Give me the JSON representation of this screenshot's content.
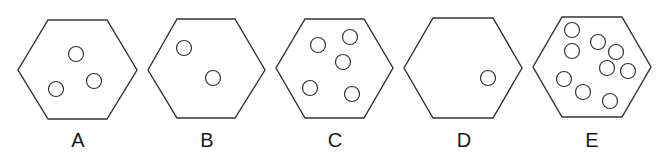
{
  "figure": {
    "stroke_color": "#333333",
    "panels": [
      {
        "label": "A",
        "circle_count": 3,
        "hexagon": [
          [
            48,
            20
          ],
          [
            107,
            20
          ],
          [
            137,
            70
          ],
          [
            107,
            119
          ],
          [
            48,
            119
          ],
          [
            18,
            70
          ]
        ],
        "circles": [
          [
            76,
            54
          ],
          [
            94,
            81
          ],
          [
            56,
            89
          ]
        ],
        "label_x": 78
      },
      {
        "label": "B",
        "circle_count": 2,
        "hexagon": [
          [
            177,
            19
          ],
          [
            235,
            19
          ],
          [
            265,
            70
          ],
          [
            235,
            118
          ],
          [
            177,
            118
          ],
          [
            148,
            70
          ]
        ],
        "circles": [
          [
            184,
            48
          ],
          [
            213,
            78
          ]
        ],
        "label_x": 207
      },
      {
        "label": "C",
        "circle_count": 5,
        "hexagon": [
          [
            305,
            19
          ],
          [
            364,
            19
          ],
          [
            393,
            68
          ],
          [
            364,
            118
          ],
          [
            305,
            118
          ],
          [
            276,
            68
          ]
        ],
        "circles": [
          [
            318,
            45
          ],
          [
            350,
            37
          ],
          [
            343,
            62
          ],
          [
            310,
            88
          ],
          [
            352,
            94
          ]
        ],
        "label_x": 335
      },
      {
        "label": "D",
        "circle_count": 1,
        "hexagon": [
          [
            433,
            18
          ],
          [
            493,
            18
          ],
          [
            522,
            68
          ],
          [
            493,
            118
          ],
          [
            433,
            118
          ],
          [
            404,
            68
          ]
        ],
        "circles": [
          [
            488,
            78
          ]
        ],
        "label_x": 464
      },
      {
        "label": "E",
        "circle_count": 9,
        "hexagon": [
          [
            562,
            17
          ],
          [
            622,
            17
          ],
          [
            651,
            67
          ],
          [
            622,
            117
          ],
          [
            562,
            117
          ],
          [
            533,
            67
          ]
        ],
        "circles": [
          [
            572,
            30
          ],
          [
            572,
            51
          ],
          [
            598,
            42
          ],
          [
            616,
            52
          ],
          [
            607,
            68
          ],
          [
            628,
            71
          ],
          [
            564,
            79
          ],
          [
            583,
            92
          ],
          [
            610,
            101
          ]
        ],
        "label_x": 592
      }
    ],
    "circle_radius": 7.5
  }
}
